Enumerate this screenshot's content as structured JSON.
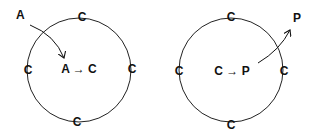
{
  "diagrams": [
    {
      "name": "import",
      "outer_label": "A",
      "center_text": "A → C",
      "ring_labels": [
        "C",
        "C",
        "C",
        "C"
      ]
    },
    {
      "name": "export",
      "outer_label": "P",
      "center_text": "C → P",
      "ring_labels": [
        "C",
        "C",
        "C",
        "C"
      ]
    }
  ]
}
